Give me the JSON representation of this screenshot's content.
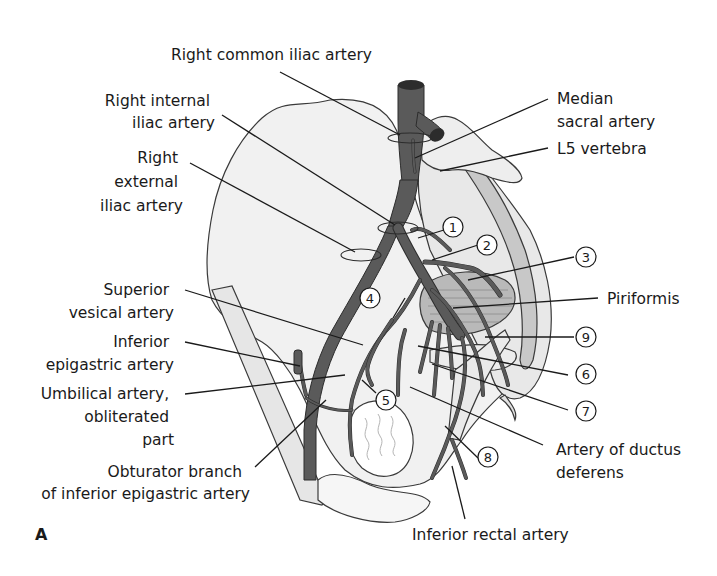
{
  "figure": {
    "panel_letter": "A",
    "colors": {
      "artery": "#5a5a5a",
      "artery_edge": "#2c2c2c",
      "bone_fill": "#f1f1f1",
      "sacrum_fill": "#c8c8c8",
      "muscle_fill": "#b9b9b9",
      "line": "#1a1a1a",
      "background": "#ffffff"
    }
  },
  "labels": {
    "right_common_iliac": "Right common iliac artery",
    "right_internal_iliac": [
      "Right internal",
      "iliac artery"
    ],
    "right_external_iliac": [
      "Right",
      "external",
      "iliac artery"
    ],
    "superior_vesical": [
      "Superior",
      "vesical artery"
    ],
    "inferior_epigastric": [
      "Inferior",
      "epigastric artery"
    ],
    "umbilical": [
      "Umbilical artery,",
      "obliterated",
      "part"
    ],
    "obturator_branch": [
      "Obturator branch",
      "of inferior epigastric artery"
    ],
    "median_sacral": [
      "Median",
      "sacral artery"
    ],
    "l5_vertebra": "L5 vertebra",
    "piriformis": "Piriformis",
    "ductus_deferens": [
      "Artery of ductus",
      "deferens"
    ],
    "inferior_rectal": "Inferior rectal artery"
  },
  "numbered_markers": [
    {
      "id": "1",
      "label": "1"
    },
    {
      "id": "2",
      "label": "2"
    },
    {
      "id": "3",
      "label": "3"
    },
    {
      "id": "4",
      "label": "4"
    },
    {
      "id": "5",
      "label": "5"
    },
    {
      "id": "6",
      "label": "6"
    },
    {
      "id": "7",
      "label": "7"
    },
    {
      "id": "8",
      "label": "8"
    },
    {
      "id": "9",
      "label": "9"
    }
  ]
}
